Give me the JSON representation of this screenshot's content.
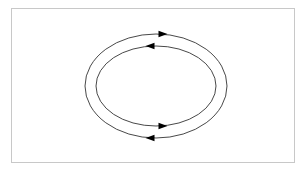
{
  "diagram": {
    "type": "cycle",
    "colors": {
      "stroke": "#333333",
      "arrow": "#000000",
      "frame": "#c8c8c8",
      "background": "#ffffff"
    },
    "center": [
      156,
      86
    ],
    "loops": [
      {
        "name": "outer-loop",
        "rx": 71,
        "ry": 52,
        "arrows": [
          {
            "position": "top",
            "x": 163,
            "y": 34,
            "direction": "right"
          },
          {
            "position": "bottom",
            "x": 150,
            "y": 138,
            "direction": "left"
          }
        ]
      },
      {
        "name": "inner-loop",
        "rx": 60,
        "ry": 40,
        "arrows": [
          {
            "position": "top",
            "x": 150,
            "y": 46,
            "direction": "left"
          },
          {
            "position": "bottom",
            "x": 163,
            "y": 126,
            "direction": "right"
          }
        ]
      }
    ]
  }
}
